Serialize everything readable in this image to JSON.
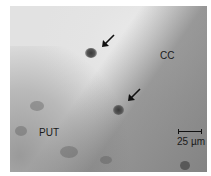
{
  "image": {
    "description": "Grayscale light micrograph showing boundary between corpus callosum and putamen with two labeled cells",
    "background_color": "#ffffff",
    "region_labels": [
      {
        "text": "CC",
        "meaning": "corpus callosum"
      },
      {
        "text": "PUT",
        "meaning": "putamen"
      }
    ],
    "arrows": [
      {
        "points_to": "upper cell",
        "direction": "down-left"
      },
      {
        "points_to": "lower cell",
        "direction": "down-left"
      }
    ],
    "scale_bar": {
      "label": "25 µm"
    }
  }
}
